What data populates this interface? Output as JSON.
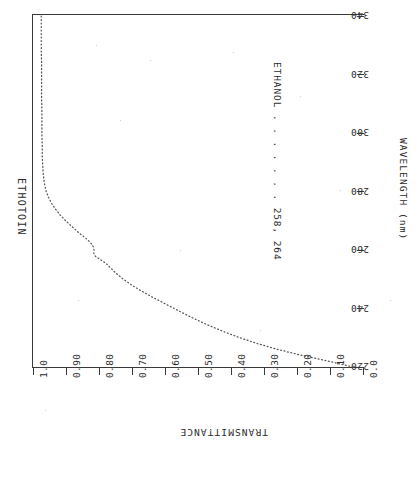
{
  "chart_data": {
    "type": "line",
    "title": "ETHOTOIN",
    "xlabel": "WAVELENGTH (nm)",
    "ylabel": "TRANSMITTANCE",
    "xlim": [
      220,
      340
    ],
    "ylim": [
      0.0,
      1.0
    ],
    "grid": false,
    "legend_position": "inside-right",
    "orientation_note": "chart printed rotated 180 degrees on the page",
    "xticks": [
      340,
      320,
      300,
      280,
      260,
      240,
      220
    ],
    "xtick_labels": [
      "340",
      "320",
      "300",
      "280",
      "260",
      "240",
      "220"
    ],
    "yticks": [
      1.0,
      0.9,
      0.8,
      0.7,
      0.6,
      0.5,
      0.4,
      0.3,
      0.2,
      0.1,
      0.0
    ],
    "ytick_labels": [
      "1.0",
      "0.90",
      "0.80",
      "0.70",
      "0.60",
      "0.50",
      "0.40",
      "0.30",
      "0.20",
      "0.10",
      "0.0"
    ],
    "annotations": [
      {
        "name": "solvent-and-maxima",
        "text": "ETHANOL . . . . . . .  258, 264"
      }
    ],
    "series": [
      {
        "name": "ethotoin-transmittance",
        "solvent": "ETHANOL",
        "absorption_maxima_nm": [
          258,
          264
        ],
        "style": "dotted",
        "x": [
          340,
          336,
          332,
          328,
          324,
          320,
          316,
          312,
          308,
          304,
          300,
          296,
          292,
          290,
          288,
          286,
          284,
          282,
          280,
          278,
          276,
          274,
          272,
          270,
          268,
          266,
          265,
          264,
          263,
          262,
          261,
          260,
          259,
          258,
          257,
          256,
          255,
          254,
          252,
          250,
          248,
          246,
          244,
          242,
          240,
          238,
          236,
          234,
          232,
          230,
          228,
          226,
          224,
          222,
          220
        ],
        "y": [
          0.975,
          0.975,
          0.975,
          0.975,
          0.974,
          0.974,
          0.974,
          0.974,
          0.973,
          0.973,
          0.973,
          0.972,
          0.972,
          0.971,
          0.97,
          0.969,
          0.967,
          0.964,
          0.96,
          0.953,
          0.944,
          0.932,
          0.918,
          0.901,
          0.882,
          0.862,
          0.851,
          0.84,
          0.83,
          0.822,
          0.817,
          0.815,
          0.816,
          0.812,
          0.8,
          0.786,
          0.775,
          0.766,
          0.748,
          0.726,
          0.701,
          0.672,
          0.64,
          0.606,
          0.572,
          0.538,
          0.502,
          0.463,
          0.42,
          0.373,
          0.32,
          0.258,
          0.186,
          0.105,
          0.03
        ]
      }
    ]
  },
  "axes": {
    "wavelength": {
      "title": "WAVELENGTH (nm)",
      "labels": [
        "340",
        "320",
        "300",
        "280",
        "260",
        "240",
        "220"
      ]
    },
    "transmittance": {
      "title": "TRANSMITTANCE",
      "labels": [
        "1.0",
        "0.90",
        "0.80",
        "0.70",
        "0.60",
        "0.50",
        "0.40",
        "0.30",
        "0.20",
        "0.10",
        "0.0"
      ]
    }
  },
  "header": {
    "compound": "ETHOTOIN"
  },
  "legend": {
    "line": "ETHANOL . . . . . . .  258, 264"
  },
  "colors": {
    "ink": "#2b2b2b",
    "rule": "#3a3a3a",
    "trace": "#555555",
    "paper": "#ffffff"
  }
}
